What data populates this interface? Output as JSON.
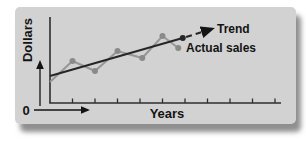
{
  "labels": {
    "ylabel": "Dollars",
    "xlabel": "Years",
    "origin": "0",
    "trend": "Trend",
    "actual": "Actual sales"
  },
  "colors": {
    "panel_bg": "#d2d2d2",
    "axis": "#2e2e2e",
    "text": "#141414",
    "trend_line": "#262626",
    "actual_line": "#979797",
    "actual_dot": "#8a8a8a"
  },
  "chart_data": {
    "type": "line",
    "title": "",
    "xlabel": "Years",
    "ylabel": "Dollars",
    "origin_label": "0",
    "grid": false,
    "axis_numeric_labels": false,
    "x_tick_count": 10,
    "x_units": "years (ticks unlabeled)",
    "y_units": "dollars (relative, unlabeled)",
    "legend_position": "inline-annotations",
    "series": [
      {
        "name": "Actual sales",
        "style": "solid-dots",
        "color": "#979797",
        "dot_color": "#8a8a8a",
        "x": [
          0,
          1,
          2,
          3,
          4.1,
          5,
          5.7
        ],
        "values": [
          21,
          42,
          32,
          52,
          45,
          67,
          55
        ]
      },
      {
        "name": "Trend",
        "style": "solid",
        "end_dot": true,
        "color": "#262626",
        "x": [
          0,
          5.9
        ],
        "values": [
          27,
          65
        ]
      },
      {
        "name": "Trend projection",
        "style": "dashed-arrow",
        "color": "#262626",
        "x": [
          6.05,
          7.2
        ],
        "values": [
          66,
          74
        ]
      }
    ]
  }
}
